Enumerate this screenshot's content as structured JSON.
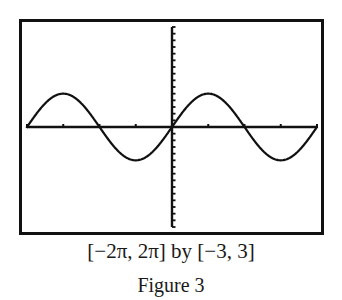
{
  "chart_data": {
    "type": "line",
    "title": "",
    "function": "y = sin(x)",
    "xlabel": "",
    "ylabel": "",
    "xlim": [
      -6.2832,
      6.2832
    ],
    "ylim": [
      -3,
      3
    ],
    "x_window_label": "[-2π, 2π]",
    "y_window_label": "[-3, 3]",
    "x_tick_step": 1.5708,
    "y_tick_step": 0.2,
    "grid": false,
    "legend": null,
    "series": [
      {
        "name": "y = sin x",
        "x": [
          -6.2832,
          -4.7124,
          -3.1416,
          -1.5708,
          0,
          1.5708,
          3.1416,
          4.7124,
          6.2832
        ],
        "values": [
          0,
          1,
          0,
          -1,
          0,
          1,
          0,
          -1,
          0
        ]
      }
    ]
  },
  "caption": {
    "window": "[−2π, 2π] by [−3, 3]",
    "figure_label": "Figure 3"
  },
  "colors": {
    "ink": "#111111",
    "background": "#ffffff"
  }
}
